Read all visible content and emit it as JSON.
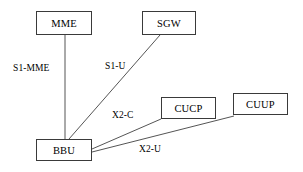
{
  "diagram": {
    "type": "network-topology",
    "background_color": "#ffffff",
    "line_color": "#555555",
    "border_color": "#3a3a3a",
    "text_color": "#000000",
    "nodes": [
      {
        "id": "mme",
        "label": "MME",
        "x": 36,
        "y": 11,
        "w": 56,
        "h": 24
      },
      {
        "id": "sgw",
        "label": "SGW",
        "x": 142,
        "y": 11,
        "w": 54,
        "h": 24
      },
      {
        "id": "cucp",
        "label": "CUCP",
        "x": 161,
        "y": 97,
        "w": 55,
        "h": 22
      },
      {
        "id": "cuup",
        "label": "CUUP",
        "x": 233,
        "y": 93,
        "w": 55,
        "h": 22
      },
      {
        "id": "bbu",
        "label": "BBU",
        "x": 36,
        "y": 139,
        "w": 56,
        "h": 22
      }
    ],
    "edges": [
      {
        "id": "s1-mme",
        "label": "S1-MME",
        "from": "mme",
        "to": "bbu",
        "x1": 65,
        "y1": 35,
        "x2": 65,
        "y2": 139
      },
      {
        "id": "s1-u",
        "label": "S1-U",
        "from": "sgw",
        "to": "bbu",
        "x1": 160,
        "y1": 35,
        "x2": 69,
        "y2": 139
      },
      {
        "id": "x2-c",
        "label": "X2-C",
        "from": "cucp",
        "to": "bbu",
        "x1": 161,
        "y1": 119,
        "x2": 92,
        "y2": 149
      },
      {
        "id": "x2-u",
        "label": "X2-U",
        "from": "cuup",
        "to": "bbu",
        "x1": 234,
        "y1": 116,
        "x2": 92,
        "y2": 152
      }
    ],
    "edge_labels": [
      {
        "id": "s1-mme-label",
        "text": "S1-MME",
        "x": 12,
        "y": 63
      },
      {
        "id": "s1-u-label",
        "text": "S1-U",
        "x": 104,
        "y": 61
      },
      {
        "id": "x2-c-label",
        "text": "X2-C",
        "x": 111,
        "y": 110
      },
      {
        "id": "x2-u-label",
        "text": "X2-U",
        "x": 138,
        "y": 144
      }
    ]
  }
}
